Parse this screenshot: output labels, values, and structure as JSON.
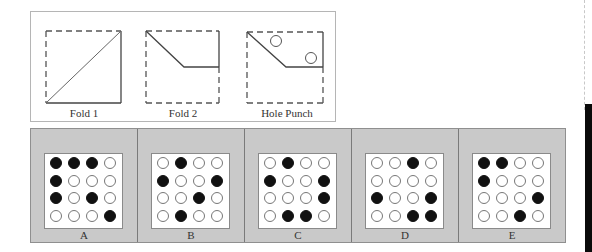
{
  "top_panel": {
    "figures": [
      {
        "label": "Fold 1",
        "icon": "fold-diagonal"
      },
      {
        "label": "Fold 2",
        "icon": "fold-corner"
      },
      {
        "label": "Hole Punch",
        "icon": "hole-punch"
      }
    ]
  },
  "options": [
    {
      "label": "A",
      "grid": [
        [
          1,
          1,
          1,
          0
        ],
        [
          1,
          0,
          0,
          0
        ],
        [
          1,
          0,
          1,
          0
        ],
        [
          0,
          0,
          0,
          1
        ]
      ]
    },
    {
      "label": "B",
      "grid": [
        [
          0,
          1,
          0,
          0
        ],
        [
          1,
          0,
          0,
          1
        ],
        [
          0,
          0,
          1,
          0
        ],
        [
          0,
          1,
          0,
          0
        ]
      ]
    },
    {
      "label": "C",
      "grid": [
        [
          0,
          1,
          0,
          0
        ],
        [
          1,
          0,
          0,
          1
        ],
        [
          0,
          0,
          0,
          1
        ],
        [
          0,
          1,
          1,
          0
        ]
      ]
    },
    {
      "label": "D",
      "grid": [
        [
          0,
          0,
          1,
          0
        ],
        [
          0,
          0,
          0,
          0
        ],
        [
          1,
          0,
          0,
          1
        ],
        [
          0,
          0,
          1,
          1
        ]
      ]
    },
    {
      "label": "E",
      "grid": [
        [
          1,
          1,
          0,
          0
        ],
        [
          1,
          0,
          0,
          0
        ],
        [
          0,
          0,
          0,
          1
        ],
        [
          0,
          0,
          1,
          0
        ]
      ]
    }
  ],
  "colors": {
    "panel_gray": "#c9c9c9",
    "hole_filled": "#111111",
    "hole_empty": "#ffffff"
  }
}
